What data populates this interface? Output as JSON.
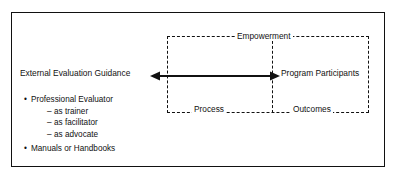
{
  "figure": {
    "frame": {
      "name": "outer-frame",
      "color": "#111111"
    },
    "left_label": "External Evaluation Guidance",
    "right_label": "Program Participants",
    "dashed_region": {
      "top_label": "Empowerment",
      "bottom_left_label": "Process",
      "bottom_right_label": "Outcomes",
      "border_style": "dashed",
      "color": "#111111"
    },
    "arrow": {
      "name": "double-headed-arrow",
      "direction": "bidirectional",
      "color": "#111111"
    },
    "bullets": [
      {
        "marker": "•",
        "text": "Professional Evaluator",
        "children": [
          {
            "marker": "–",
            "text": "as trainer"
          },
          {
            "marker": "–",
            "text": "as facilitator"
          },
          {
            "marker": "–",
            "text": "as advocate"
          }
        ]
      },
      {
        "marker": "•",
        "text": "Manuals or Handbooks",
        "children": []
      }
    ]
  }
}
